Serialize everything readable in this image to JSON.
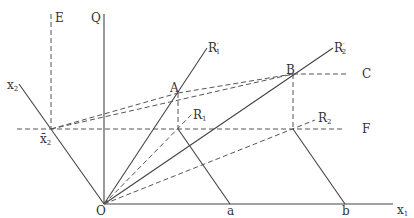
{
  "diagram": {
    "colors": {
      "line": "#444444",
      "dash": "#555555",
      "text": "#333333",
      "background": "#ffffff"
    },
    "labels": {
      "E": "E",
      "Q": "Q",
      "x2": "x",
      "x2_sub": "2",
      "x2bar": "x̄",
      "x2bar_sub": "2",
      "R1prime": "R",
      "R1prime_sub": "1",
      "R2prime": "R",
      "R2prime_sub": "2",
      "prime": "′",
      "A": "A",
      "B": "B",
      "C": "C",
      "R1": "R",
      "R1_sub": "1",
      "R2": "R",
      "R2_sub": "2",
      "F": "F",
      "O": "O",
      "a": "a",
      "b": "b",
      "x1": "x",
      "x1_sub": "1"
    }
  }
}
